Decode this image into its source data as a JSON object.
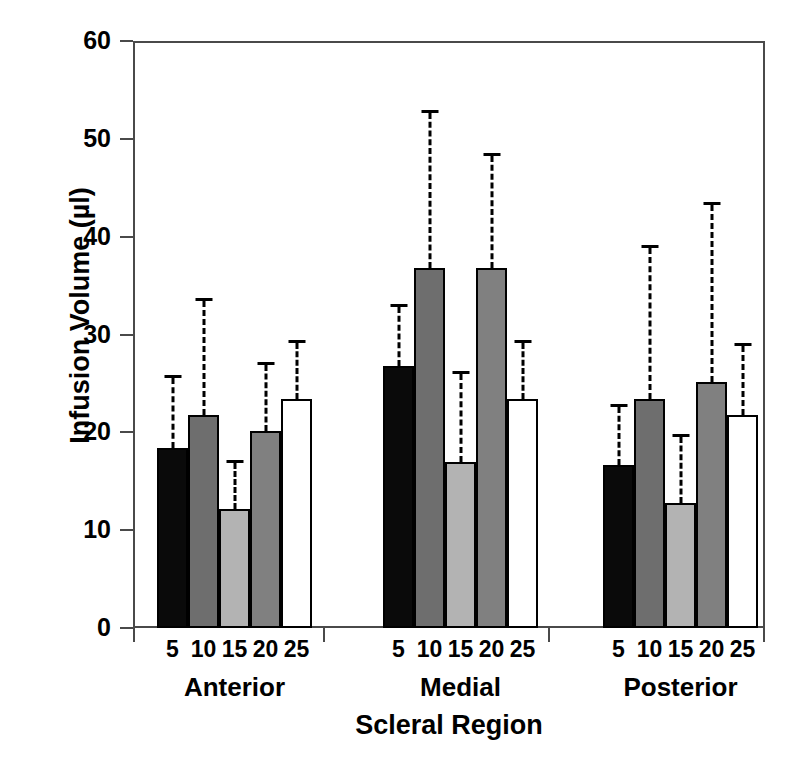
{
  "chart_data": {
    "type": "bar",
    "title": "",
    "xlabel": "Scleral Region",
    "ylabel": "Infusion Volume (µl)",
    "ylim": [
      0,
      60
    ],
    "yticks": [
      0,
      10,
      20,
      30,
      40,
      50,
      60
    ],
    "ytick_labels": [
      "0",
      "10",
      "20",
      "30",
      "40",
      "50",
      "60"
    ],
    "grid": false,
    "legend": "none",
    "error_bars": "dashed vertical lines with horizontal caps (upper only)",
    "categories": [
      "Anterior",
      "Medial",
      "Posterior"
    ],
    "subcategories": [
      "5",
      "10",
      "15",
      "20",
      "25"
    ],
    "subcategory_axis_label": "Infusion rate",
    "bar_fills": [
      "black",
      "dark-gray",
      "light-gray",
      "medium-gray",
      "white"
    ],
    "bar_fill_colors": [
      "#0a0a0a",
      "#6e6e6e",
      "#b3b3b3",
      "#808080",
      "#ffffff"
    ],
    "groups": [
      {
        "name": "Anterior",
        "bars": [
          {
            "label": "5",
            "value": 18.4,
            "error_top": 25.6,
            "fill": "black"
          },
          {
            "label": "10",
            "value": 21.8,
            "error_top": 33.4,
            "fill": "dark-gray"
          },
          {
            "label": "15",
            "value": 12.2,
            "error_top": 16.9,
            "fill": "light-gray"
          },
          {
            "label": "20",
            "value": 20.1,
            "error_top": 26.9,
            "fill": "medium-gray"
          },
          {
            "label": "25",
            "value": 23.4,
            "error_top": 29.1,
            "fill": "white"
          }
        ]
      },
      {
        "name": "Medial",
        "bars": [
          {
            "label": "5",
            "value": 26.8,
            "error_top": 32.8,
            "fill": "black"
          },
          {
            "label": "10",
            "value": 36.8,
            "error_top": 52.6,
            "fill": "dark-gray"
          },
          {
            "label": "15",
            "value": 17.0,
            "error_top": 26.0,
            "fill": "light-gray"
          },
          {
            "label": "20",
            "value": 36.8,
            "error_top": 48.2,
            "fill": "medium-gray"
          },
          {
            "label": "25",
            "value": 23.4,
            "error_top": 29.1,
            "fill": "white"
          }
        ]
      },
      {
        "name": "Posterior",
        "bars": [
          {
            "label": "5",
            "value": 16.7,
            "error_top": 22.6,
            "fill": "black"
          },
          {
            "label": "10",
            "value": 23.4,
            "error_top": 38.8,
            "fill": "dark-gray"
          },
          {
            "label": "15",
            "value": 12.8,
            "error_top": 19.5,
            "fill": "light-gray"
          },
          {
            "label": "20",
            "value": 25.1,
            "error_top": 43.2,
            "fill": "medium-gray"
          },
          {
            "label": "25",
            "value": 21.8,
            "error_top": 28.8,
            "fill": "white"
          }
        ]
      }
    ]
  }
}
